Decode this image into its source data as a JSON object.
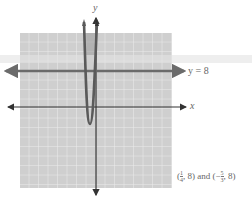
{
  "diagram": {
    "type": "coordinate-graph",
    "axes": {
      "x_label": "x",
      "y_label": "y"
    },
    "horizontal_line": {
      "label": "y = 8",
      "equation": "y = 8"
    },
    "curve": {
      "type": "parabola",
      "opens": "up"
    },
    "intersection_answer": {
      "prefix": "(",
      "p1_num": "1",
      "p1_den": "4",
      "p1_y": ", 8)",
      "conj": " and (−",
      "p2_num": "5",
      "p2_den": "3",
      "p2_y": ", 8)"
    },
    "colors": {
      "grid_bg": "#cfcfcf",
      "grid_line": "#eeeeee",
      "axis": "#333333",
      "line": "#6b6b6b",
      "parabola": "#5a5a5a",
      "highlight": "#9a9a9a",
      "text": "#666666"
    }
  }
}
